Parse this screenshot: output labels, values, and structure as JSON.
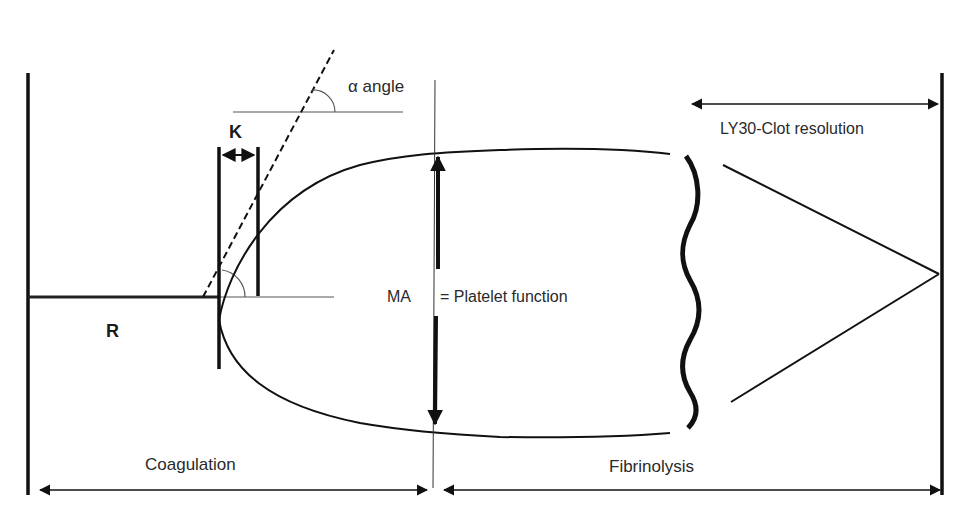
{
  "diagram": {
    "labels": {
      "alpha": "α angle",
      "k": "K",
      "r": "R",
      "ma": "MA",
      "ma_meaning": "= Platelet function",
      "ly30": "LY30-Clot resolution",
      "coagulation": "Coagulation",
      "fibrinolysis": "Fibrinolysis"
    },
    "colors": {
      "stroke": "#111111",
      "thin_stroke": "#555555",
      "text": "#2a2a2a",
      "background": "#ffffff"
    }
  }
}
